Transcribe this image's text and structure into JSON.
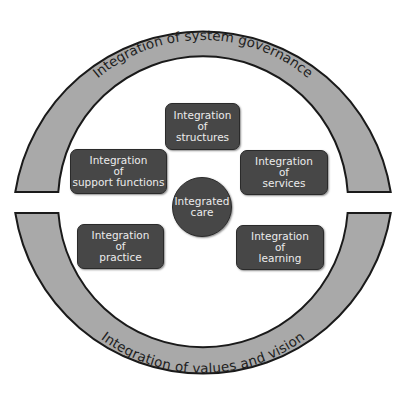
{
  "diagram": {
    "outer_ring": {
      "top_label": "Integration of system governance",
      "bottom_label": "Integration of values and vision"
    },
    "center": {
      "line1": "Integrated",
      "line2": "care"
    },
    "nodes": [
      {
        "id": "structures",
        "line1": "Integration",
        "line2": "of",
        "line3": "structures"
      },
      {
        "id": "support-functions",
        "line1": "Integration",
        "line2": "of",
        "line3": "support functions"
      },
      {
        "id": "services",
        "line1": "Integration",
        "line2": "of",
        "line3": "services"
      },
      {
        "id": "practice",
        "line1": "Integration",
        "line2": "of",
        "line3": "practice"
      },
      {
        "id": "learning",
        "line1": "Integration",
        "line2": "of",
        "line3": "learning"
      }
    ],
    "colors": {
      "ring_fill": "#a9a9a9",
      "ring_stroke": "#1a1a1a",
      "node_fill": "#474747",
      "node_text": "#ececec"
    }
  }
}
